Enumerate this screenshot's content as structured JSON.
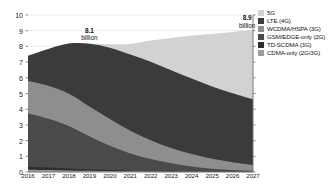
{
  "chart_data": {
    "type": "area",
    "stacked": true,
    "title": "",
    "subtitle": "",
    "xlabel": "",
    "ylabel": "",
    "categories": [
      "2016",
      "2017",
      "2018",
      "2019",
      "2020",
      "2021",
      "2022",
      "2023",
      "2024",
      "2025",
      "2026",
      "2027"
    ],
    "ylim": [
      0,
      10
    ],
    "yticks": [
      0,
      1,
      2,
      3,
      4,
      5,
      6,
      7,
      8,
      9,
      10
    ],
    "ytick_labels": [
      "0",
      "1",
      "2",
      "3",
      "4",
      "5",
      "6",
      "7",
      "8",
      "9",
      "10"
    ],
    "grid": true,
    "legend_position": "right",
    "units": "billion subscriptions",
    "series": [
      {
        "name": "5G",
        "color": "#d2d2d2",
        "values": [
          0,
          0,
          0,
          0.02,
          0.22,
          0.68,
          1.35,
          2.05,
          2.75,
          3.35,
          3.9,
          4.4
        ]
      },
      {
        "name": "LTE (4G)",
        "color": "#3b3b3b",
        "values": [
          1.62,
          2.35,
          3.2,
          4.0,
          4.55,
          4.85,
          5.0,
          4.95,
          4.8,
          4.6,
          4.4,
          4.2
        ]
      },
      {
        "name": "WCDMA/HSPA (3G)",
        "color": "#8e8e8e",
        "values": [
          2.05,
          2.1,
          2.05,
          1.9,
          1.7,
          1.45,
          1.2,
          0.98,
          0.8,
          0.64,
          0.5,
          0.38
        ]
      },
      {
        "name": "GSM/EDGE-only (2G)",
        "color": "#4a4a4a",
        "values": [
          3.4,
          3.1,
          2.7,
          2.1,
          1.55,
          1.1,
          0.78,
          0.52,
          0.34,
          0.2,
          0.12,
          0.06
        ]
      },
      {
        "name": "TD-SCDMA (3G)",
        "color": "#2e2e2e",
        "values": [
          0.2,
          0.17,
          0.13,
          0.09,
          0.06,
          0.04,
          0.02,
          0.01,
          0.0,
          0.0,
          0.0,
          0.0
        ]
      },
      {
        "name": "CDMA-only (2G/3G)",
        "color": "#9c9c9c",
        "values": [
          0.14,
          0.12,
          0.1,
          0.08,
          0.06,
          0.04,
          0.03,
          0.02,
          0.01,
          0.0,
          0.0,
          0.0
        ]
      }
    ],
    "totals": [
      7.41,
      7.84,
      8.18,
      8.19,
      8.14,
      8.16,
      8.38,
      8.53,
      8.7,
      8.79,
      8.92,
      9.04
    ],
    "annotations": [
      {
        "id": "peak-2019",
        "number": "8.1",
        "unit": "billion",
        "x_category": "2019",
        "value": 8.1
      },
      {
        "id": "end-2027",
        "number": "8.9",
        "unit": "billion",
        "x_category": "2027",
        "value": 8.9
      }
    ]
  },
  "legend": {
    "items": [
      {
        "label": "5G",
        "color": "#d2d2d2"
      },
      {
        "label": "LTE (4G)",
        "color": "#3b3b3b"
      },
      {
        "label": "WCDMA/HSPA (3G)",
        "color": "#8e8e8e"
      },
      {
        "label": "GSM/EDGE-only (2G)",
        "color": "#4a4a4a"
      },
      {
        "label": "TD-SCDMA (3G)",
        "color": "#2e2e2e"
      },
      {
        "label": "CDMA-only (2G/3G)",
        "color": "#9c9c9c"
      }
    ]
  },
  "axes": {
    "y_tick_labels": [
      "10",
      "9",
      "8",
      "7",
      "6",
      "5",
      "4",
      "3",
      "2",
      "1",
      "0"
    ],
    "x_tick_labels": [
      "2016",
      "2017",
      "2018",
      "2019",
      "2020",
      "2021",
      "2022",
      "2023",
      "2024",
      "2025",
      "2026",
      "2027"
    ]
  },
  "colors": {
    "grid": "#dcdcdc",
    "axis": "#707070",
    "text": "#1a1a1a",
    "background": "#ffffff"
  }
}
